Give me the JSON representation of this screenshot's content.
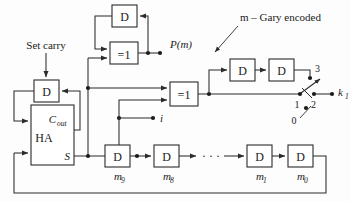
{
  "figure": {
    "type": "block-diagram",
    "colors": {
      "background": "#fdfdfd",
      "line": "#2b2b2b",
      "text": "#1a1a1a",
      "box_fill": "#ffffff"
    }
  },
  "annotations": {
    "set_carry": "Set carry",
    "gray_encoded": "m – Gary encoded",
    "p_of_m": "P(m)",
    "i_signal": "i",
    "k_output": "k",
    "k_output_sub": "1"
  },
  "blocks": {
    "d_top": {
      "label": "D",
      "name": "d-flipflop-top"
    },
    "d_carry": {
      "label": "D",
      "name": "d-flipflop-carry"
    },
    "half_adder": {
      "label": "HA",
      "carry_out": "C",
      "carry_out_sub": "out",
      "sum": "S"
    },
    "gate_left": {
      "label": "=1"
    },
    "gate_right": {
      "label": "=1"
    },
    "gray_chain": [
      {
        "label": "D",
        "name": "d-flipflop-gray-1"
      },
      {
        "label": "D",
        "name": "d-flipflop-gray-2"
      }
    ],
    "shift_register": [
      {
        "label": "D",
        "tag": "m",
        "tag_sub": "9"
      },
      {
        "label": "D",
        "tag": "m",
        "tag_sub": "8"
      },
      {
        "label": "D",
        "tag": "m",
        "tag_sub": "1"
      },
      {
        "label": "D",
        "tag": "m",
        "tag_sub": "0"
      }
    ],
    "ellipsis": "· · ·"
  },
  "switch": {
    "name": "output-selector-switch",
    "contacts": [
      {
        "label": "3",
        "position": "upper"
      },
      {
        "label": "1",
        "position": "left"
      },
      {
        "label": "2",
        "position": "lower-right"
      },
      {
        "label": "0",
        "position": "lower-left"
      }
    ]
  }
}
